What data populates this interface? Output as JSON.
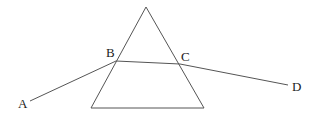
{
  "diagram": {
    "colors": {
      "stroke": "#555555",
      "label": "#222222",
      "background": "#ffffff"
    },
    "prism": {
      "apex": [
        146,
        7
      ],
      "bottom_left": [
        91,
        108
      ],
      "bottom_right": [
        204,
        108
      ]
    },
    "ray": {
      "points": {
        "A": [
          30,
          101
        ],
        "B": [
          116,
          61
        ],
        "C": [
          180,
          64
        ],
        "D": [
          288,
          85
        ]
      }
    },
    "labels": [
      {
        "id": "A",
        "text": "A",
        "x": 18,
        "y": 108
      },
      {
        "id": "B",
        "text": "B",
        "x": 106,
        "y": 57
      },
      {
        "id": "C",
        "text": "C",
        "x": 181,
        "y": 61
      },
      {
        "id": "D",
        "text": "D",
        "x": 292,
        "y": 91
      }
    ]
  }
}
